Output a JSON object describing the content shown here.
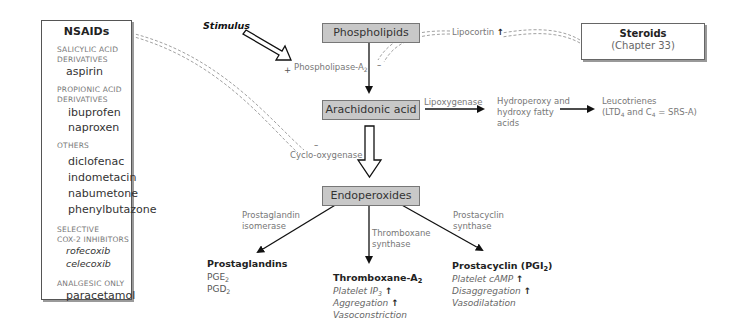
{
  "nsaids": {
    "title": "NSAIDs",
    "groups": [
      {
        "category_line1": "SALICYLIC ACID",
        "category_line2": "DERIVATIVES",
        "drugs": [
          "aspirin"
        ]
      },
      {
        "category_line1": "PROPIONIC ACID",
        "category_line2": "DERIVATIVES",
        "drugs": [
          "ibuprofen",
          "naproxen"
        ]
      },
      {
        "category_line1": "OTHERS",
        "category_line2": "",
        "drugs": [
          "diclofenac",
          "indometacin",
          "nabumetone",
          "phenylbutazone"
        ]
      },
      {
        "category_line1": "SELECTIVE",
        "category_line2": "COX-2 INHIBITORS",
        "drugs": [
          "rofecoxib",
          "celecoxib"
        ]
      },
      {
        "category_line1": "ANALGESIC ONLY",
        "category_line2": "",
        "drugs": [
          "paracetamol"
        ]
      }
    ]
  },
  "stimulus": "Stimulus",
  "steroids": {
    "title": "Steroids",
    "subtitle": "(Chapter 33)"
  },
  "nodes": {
    "phospholipids": "Phospholipids",
    "arachidonic_acid": "Arachidonic acid",
    "endoperoxides": "Endoperoxides"
  },
  "enzymes": {
    "phospholipase_prefix": "+",
    "phospholipase": "Phospholipase-A",
    "phospholipase_sub": "2",
    "phospholipase_inhibit": "–",
    "lipocortin": "Lipocortin",
    "lipocortin_arrow": "↑",
    "lipoxygenase": "Lipoxygenase",
    "cyclooxygenase_inhibit": "–",
    "cyclooxygenase": "Cyclo-oxygenase",
    "prostaglandin_isomerase_1": "Prostaglandin",
    "prostaglandin_isomerase_2": "isomerase",
    "thromboxane_synthase_1": "Thromboxane",
    "thromboxane_synthase_2": "synthase",
    "prostacyclin_synthase_1": "Prostacyclin",
    "prostacyclin_synthase_2": "synthase"
  },
  "lipoxygenase_path": {
    "hydroperoxy_1": "Hydroperoxy and",
    "hydroperoxy_2": "hydroxy fatty",
    "hydroperoxy_3": "acids",
    "leucotrienes_1": "Leucotrienes",
    "leucotrienes_2a": "(LTD",
    "leucotrienes_2sub1": "4",
    "leucotrienes_2b": " and C",
    "leucotrienes_2sub2": "4",
    "leucotrienes_2c": " = SRS-A)"
  },
  "products": {
    "prostaglandins": {
      "title": "Prostaglandins",
      "items": [
        {
          "base": "PGE",
          "sub": "2"
        },
        {
          "base": "PGD",
          "sub": "2"
        }
      ]
    },
    "thromboxane": {
      "title": "Thromboxane-A",
      "title_sub": "2",
      "effects": [
        {
          "text": "Platelet IP",
          "sub": "3",
          "arrow": "↑"
        },
        {
          "text": "Aggregation",
          "sub": "",
          "arrow": "↑"
        },
        {
          "text": "Vasoconstriction",
          "sub": "",
          "arrow": ""
        }
      ]
    },
    "prostacyclin": {
      "title": "Prostacyclin (PGI",
      "title_sub": "2",
      "title_end": ")",
      "effects": [
        {
          "text": "Platelet cAMP",
          "arrow": "↑"
        },
        {
          "text": "Disaggregation",
          "arrow": "↑"
        },
        {
          "text": "Vasodilatation",
          "arrow": ""
        }
      ]
    }
  }
}
